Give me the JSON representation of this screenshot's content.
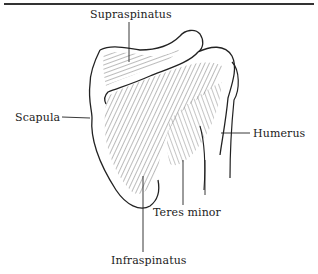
{
  "figure": {
    "labels": {
      "supraspinatus": "Supraspinatus",
      "scapula": "Scapula",
      "humerus": "Humerus",
      "teres_minor": "Teres minor",
      "infraspinatus": "Infraspinatus"
    },
    "colors": {
      "outline": "#222222",
      "muscle": "#9a9a9a",
      "muscle_light": "#c8c8c8",
      "text": "#222222"
    }
  }
}
